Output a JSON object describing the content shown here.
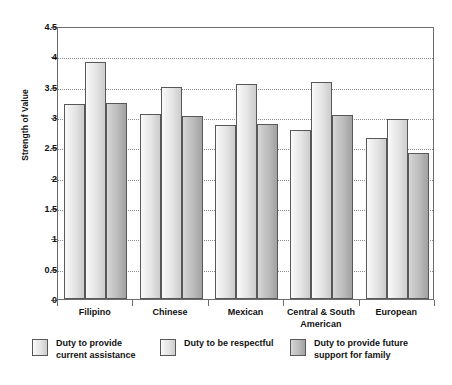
{
  "chart_data": {
    "type": "bar",
    "title": "",
    "xlabel": "",
    "ylabel": "Strength of Value",
    "ylim": [
      0,
      4.5
    ],
    "ytick_labels": [
      "0",
      "0.5",
      "1",
      "1.5",
      "2",
      "2.5",
      "3",
      "3.5",
      "4",
      "4.5"
    ],
    "ytick_values": [
      0,
      0.5,
      1,
      1.5,
      2,
      2.5,
      3,
      3.5,
      4,
      4.5
    ],
    "grid": "horizontal-dotted",
    "legend_position": "bottom",
    "categories": [
      "Filipino",
      "Chinese",
      "Mexican",
      "Central & South\nAmerican",
      "European"
    ],
    "series": [
      {
        "name": "Duty to provide\ncurrent assistance",
        "color": "#e4e4e4",
        "values": [
          3.22,
          3.05,
          2.87,
          2.78,
          2.65
        ]
      },
      {
        "name": "Duty to be respectful",
        "color": "#e4e4e4",
        "values": [
          3.91,
          3.5,
          3.54,
          3.58,
          2.97
        ]
      },
      {
        "name": "Duty to provide future\nsupport for family",
        "color": "#b8b8b8",
        "values": [
          3.23,
          3.01,
          2.88,
          3.03,
          2.41
        ]
      }
    ]
  },
  "axes": {
    "y_title": "Strength of Value"
  },
  "legend": {
    "items": [
      {
        "label": "Duty to provide\ncurrent assistance"
      },
      {
        "label": "Duty to be respectful"
      },
      {
        "label": "Duty to provide future\nsupport for family"
      }
    ]
  }
}
